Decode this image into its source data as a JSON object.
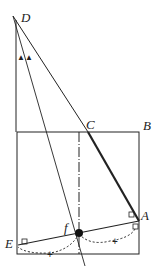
{
  "diagram": {
    "labels": {
      "D": "D",
      "C": "C",
      "B": "B",
      "A": "A",
      "E": "E",
      "f": "f"
    },
    "marks": {
      "angle_marks": "▲▲",
      "tick_mark": "+"
    },
    "colors": {
      "line": "#222222",
      "background": "#ffffff"
    }
  }
}
